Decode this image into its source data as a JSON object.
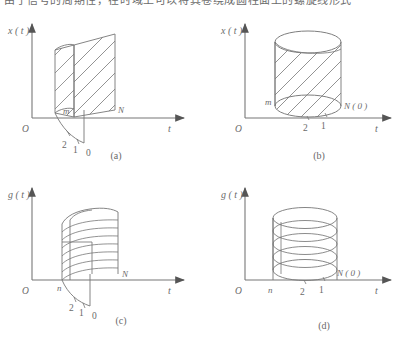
{
  "page": {
    "background_color": "#ffffff",
    "line_color": "#777777",
    "text_color": "#6a6a6a",
    "top_partial_text": "由于信号的周期性，在时域上可以将其卷绕成圆柱面上的螺旋线形式"
  },
  "figure": {
    "panels": [
      {
        "id": "a",
        "caption": "(a)",
        "y_axis_label": "x ( t )",
        "x_axis_label": "t",
        "origin_label": "O",
        "surface_type": "unrolled-cylinder-hatched",
        "hatch_style": "diagonal",
        "point_labels": [
          "m",
          "N"
        ],
        "depth_ticks": [
          "2",
          "1",
          "0"
        ]
      },
      {
        "id": "b",
        "caption": "(b)",
        "y_axis_label": "x ( t )",
        "x_axis_label": "t",
        "origin_label": "O",
        "surface_type": "closed-cylinder-hatched",
        "hatch_style": "diagonal",
        "point_labels": [
          "m",
          "N ( 0 )"
        ],
        "depth_ticks": [
          "2",
          "1"
        ]
      },
      {
        "id": "c",
        "caption": "(c)",
        "y_axis_label": "g ( t )",
        "x_axis_label": "t",
        "origin_label": "O",
        "surface_type": "unrolled-cylinder-banded",
        "hatch_style": "horizontal-bands",
        "point_labels": [
          "n",
          "N"
        ],
        "depth_ticks": [
          "2",
          "1",
          "0"
        ]
      },
      {
        "id": "d",
        "caption": "(d)",
        "y_axis_label": "g ( t )",
        "x_axis_label": "t",
        "origin_label": "O",
        "surface_type": "closed-cylinder-rings",
        "hatch_style": "stacked-ellipses",
        "point_labels": [
          "n",
          "N ( 0 )"
        ],
        "depth_ticks": [
          "2",
          "1"
        ]
      }
    ]
  }
}
